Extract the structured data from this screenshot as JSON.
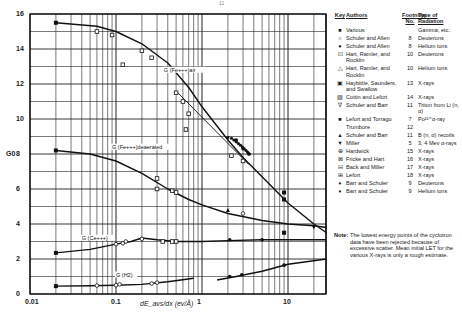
{
  "page_number": "11",
  "chart_data": {
    "type": "line",
    "title": "",
    "xlabel": "dE_avs/dx (ev/Å)",
    "ylabel": "G0",
    "xscale": "log",
    "xlim": [
      0.01,
      28
    ],
    "ylim": [
      0,
      16
    ],
    "grid": true,
    "x_tick_labels": [
      "0.01",
      "0.1",
      "1",
      "10"
    ],
    "y_tick_labels": [
      "0",
      "2",
      "4",
      "6",
      "8",
      "10",
      "12",
      "14",
      "16"
    ],
    "legend_position": "right",
    "series": [
      {
        "name": "G(Fe+++)air",
        "label": "G (Fe+++)air",
        "x": [
          0.02,
          0.06,
          0.1,
          0.2,
          0.4,
          0.7,
          1.0,
          2.0,
          3.0,
          5.0,
          10.0,
          20.0,
          28.0
        ],
        "y": [
          15.5,
          15.3,
          15.0,
          14.3,
          13.2,
          11.8,
          10.7,
          8.8,
          7.8,
          6.7,
          5.2,
          4.0,
          3.5
        ]
      },
      {
        "name": "G(Fe+++)deaerated",
        "label": "G (Fe+++)deaerated",
        "x": [
          0.02,
          0.05,
          0.1,
          0.2,
          0.4,
          0.7,
          1.0,
          2.0,
          5.0,
          10.0,
          20.0,
          28.0
        ],
        "y": [
          8.2,
          8.0,
          7.6,
          6.9,
          6.0,
          5.4,
          5.1,
          4.6,
          4.2,
          4.0,
          3.9,
          3.8
        ]
      },
      {
        "name": "G(Ce+++)",
        "label": "G (Ce+++)",
        "x": [
          0.02,
          0.05,
          0.1,
          0.15,
          0.2,
          0.3,
          0.5,
          1.0,
          2.0,
          5.0,
          10.0,
          28.0
        ],
        "y": [
          2.35,
          2.55,
          2.85,
          3.0,
          3.2,
          3.1,
          3.0,
          3.0,
          3.05,
          3.1,
          3.1,
          3.1
        ]
      },
      {
        "name": "G(H2)",
        "label": "G (H2)",
        "x": [
          0.02,
          0.05,
          0.1,
          0.2,
          0.4,
          0.8
        ],
        "y": [
          0.45,
          0.47,
          0.5,
          0.55,
          0.7,
          0.9
        ]
      },
      {
        "name": "G(H2) high LET",
        "label": "",
        "x": [
          1.5,
          2.5,
          5.0,
          10.0,
          28.0
        ],
        "y": [
          0.8,
          1.0,
          1.3,
          1.7,
          2.0
        ]
      }
    ],
    "points": [
      {
        "key": "various",
        "x": 0.02,
        "y": 15.5
      },
      {
        "key": "various",
        "x": 0.02,
        "y": 8.2
      },
      {
        "key": "various",
        "x": 0.02,
        "y": 2.35
      },
      {
        "key": "various",
        "x": 0.02,
        "y": 0.45
      },
      {
        "key": "haybittle",
        "x": 0.06,
        "y": 15.0
      },
      {
        "key": "haybittle",
        "x": 0.09,
        "y": 14.8
      },
      {
        "key": "haybittle",
        "x": 0.2,
        "y": 13.9
      },
      {
        "key": "haybittle",
        "x": 0.26,
        "y": 13.5
      },
      {
        "key": "haybittle",
        "x": 0.12,
        "y": 13.1
      },
      {
        "key": "cottin",
        "x": 0.5,
        "y": 11.5
      },
      {
        "key": "cottin",
        "x": 0.6,
        "y": 11.0
      },
      {
        "key": "cottin",
        "x": 0.7,
        "y": 10.3
      },
      {
        "key": "cottin",
        "x": 0.65,
        "y": 9.4
      },
      {
        "key": "schuler_barr_triton",
        "x": 2.0,
        "y": 8.9
      },
      {
        "key": "schuler_allen_he",
        "x": 2.5,
        "y": 8.8
      },
      {
        "key": "schuler_allen_he",
        "x": 3.0,
        "y": 8.3
      },
      {
        "key": "schuler_allen_he",
        "x": 3.5,
        "y": 8.0
      },
      {
        "key": "hart_deut",
        "x": 2.2,
        "y": 7.9
      },
      {
        "key": "hart_deut",
        "x": 3.0,
        "y": 7.6
      },
      {
        "key": "lefort_torrago",
        "x": 9.0,
        "y": 5.8
      },
      {
        "key": "lefort_torrago",
        "x": 9.0,
        "y": 5.4
      },
      {
        "key": "lefort_torrago",
        "x": 9.0,
        "y": 3.5
      },
      {
        "key": "miller",
        "x": 20.0,
        "y": 3.8
      },
      {
        "key": "hardwick",
        "x": 0.3,
        "y": 6.6
      },
      {
        "key": "fricke_hart",
        "x": 0.3,
        "y": 6.0
      },
      {
        "key": "back_miller",
        "x": 0.45,
        "y": 5.9
      },
      {
        "key": "lefort",
        "x": 0.5,
        "y": 5.8
      },
      {
        "key": "schuler_barr_b",
        "x": 2.0,
        "y": 4.8
      },
      {
        "key": "schuler_allen_deut",
        "x": 3.0,
        "y": 4.6
      },
      {
        "key": "hart_deut",
        "x": 0.35,
        "y": 3.0
      },
      {
        "key": "hart_deut",
        "x": 0.45,
        "y": 3.0
      },
      {
        "key": "hart_deut",
        "x": 0.5,
        "y": 3.0
      },
      {
        "key": "barr_schuler_he",
        "x": 2.1,
        "y": 3.1
      },
      {
        "key": "barr_schuler_he",
        "x": 5.0,
        "y": 3.1
      },
      {
        "key": "schuler_allen_deut",
        "x": 0.1,
        "y": 2.85
      },
      {
        "key": "schuler_allen_deut",
        "x": 0.12,
        "y": 2.9
      },
      {
        "key": "schuler_allen_deut",
        "x": 0.13,
        "y": 3.0
      },
      {
        "key": "schuler_allen_deut",
        "x": 0.2,
        "y": 3.15
      },
      {
        "key": "schuler_allen_deut",
        "x": 0.06,
        "y": 0.48
      },
      {
        "key": "schuler_allen_deut",
        "x": 0.1,
        "y": 0.5
      },
      {
        "key": "schuler_allen_deut",
        "x": 0.11,
        "y": 0.55
      },
      {
        "key": "schuler_allen_deut",
        "x": 0.26,
        "y": 0.6
      },
      {
        "key": "schuler_allen_deut",
        "x": 0.3,
        "y": 0.65
      },
      {
        "key": "schuler_allen_he",
        "x": 2.1,
        "y": 1.0
      },
      {
        "key": "schuler_allen_he",
        "x": 2.9,
        "y": 1.1
      },
      {
        "key": "schuler_allen_he",
        "x": 9.0,
        "y": 1.65
      }
    ],
    "annotations": [
      "G (Fe+++)air",
      "G (Fe+++)deaerated",
      "G (Ce+++)",
      "G (H2)"
    ]
  },
  "legend": {
    "headers": {
      "key": "Key",
      "authors": "Authors",
      "footnote": "Footnote No.",
      "type": "Type of Radiation"
    },
    "rows": [
      {
        "sym": "■",
        "authors": "Various",
        "fn": "",
        "type": "Gamma, etc."
      },
      {
        "sym": "○",
        "authors": "Schuler and Allen",
        "fn": "8",
        "type": "Deuterons"
      },
      {
        "sym": "●",
        "authors": "Schuler and Allen",
        "fn": "8",
        "type": "Helium ions"
      },
      {
        "sym": "⊡",
        "authors": "Hart, Ramler, and Rocklin",
        "fn": "10",
        "type": "Deuterons"
      },
      {
        "sym": "△",
        "authors": "Hart, Ramler, and Rocklin",
        "fn": "10",
        "type": "Helium ions"
      },
      {
        "sym": "▣",
        "authors": "Haybittle, Saunders, and Swallow",
        "fn": "13",
        "type": "X-rays"
      },
      {
        "sym": "▨",
        "authors": "Cottin and Lefort",
        "fn": "14",
        "type": "X-rays"
      },
      {
        "sym": "∇",
        "authors": "Schuler and Barr",
        "fn": "11",
        "type": "Triton from Li (n, α)"
      },
      {
        "sym": "■",
        "authors": "Lefort and Torrago",
        "fn": "7",
        "type": "Po²¹⁰ α-ray"
      },
      {
        "sym": "",
        "authors": "Trumbore",
        "fn": "12",
        "type": ""
      },
      {
        "sym": "▲",
        "authors": "Schuler and Barr",
        "fn": "11",
        "type": "B (n, α) recoils"
      },
      {
        "sym": "▼",
        "authors": "Miller",
        "fn": "5",
        "type": "3, 4 Mev α-rays"
      },
      {
        "sym": "⊕",
        "authors": "Hardwick",
        "fn": "15",
        "type": "X-rays"
      },
      {
        "sym": "⊠",
        "authors": "Fricke and Hart",
        "fn": "16",
        "type": "X-rays"
      },
      {
        "sym": "⊟",
        "authors": "Back and Miller",
        "fn": "17",
        "type": "X-rays"
      },
      {
        "sym": "⊞",
        "authors": "Lefort",
        "fn": "18",
        "type": "X-rays"
      },
      {
        "sym": "♦",
        "authors": "Barr and Schuler",
        "fn": "9",
        "type": "Deuterons"
      },
      {
        "sym": "♦",
        "authors": "Barr and Schuler",
        "fn": "9",
        "type": "Helium ions"
      }
    ]
  },
  "note": {
    "label": "Note:",
    "text": "The lowest energy points of the cyclotron data have been rejected because of excessive scatter. Mean initial LET for the various X-rays is only a rough estimate."
  }
}
